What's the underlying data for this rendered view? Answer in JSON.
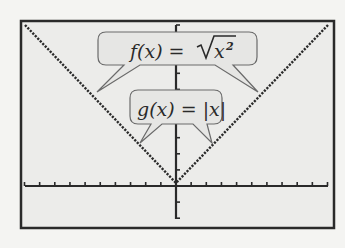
{
  "screen": {
    "background": "#f4f4f2",
    "screen_fill": "#ececea",
    "ink": "#2a2a2a",
    "callout_fill": "#e6e6e4",
    "callout_stroke": "#6a6a6a"
  },
  "callouts": [
    {
      "id": "f",
      "label_fn": "f(x) = ",
      "label_radicand": "x",
      "label_exponent": "2",
      "full_label": "f(x) = √(x²)"
    },
    {
      "id": "g",
      "label": "g(x) = |x|"
    }
  ],
  "chart_data": {
    "type": "line",
    "title": "",
    "xlabel": "",
    "ylabel": "",
    "xlim": [
      -10,
      10
    ],
    "ylim": [
      -2,
      10
    ],
    "grid": false,
    "x_tick_spacing": 1,
    "y_tick_spacing": 1,
    "series": [
      {
        "name": "f(x) = √(x²)",
        "x": [
          -10,
          -5,
          0,
          5,
          10
        ],
        "y": [
          10,
          5,
          0,
          5,
          10
        ]
      },
      {
        "name": "g(x) = |x|",
        "x": [
          -10,
          -5,
          0,
          5,
          10
        ],
        "y": [
          10,
          5,
          0,
          5,
          10
        ]
      }
    ],
    "annotations": [
      "f(x) = √(x²)",
      "g(x) = |x|"
    ],
    "legend": "callout-bubbles"
  }
}
